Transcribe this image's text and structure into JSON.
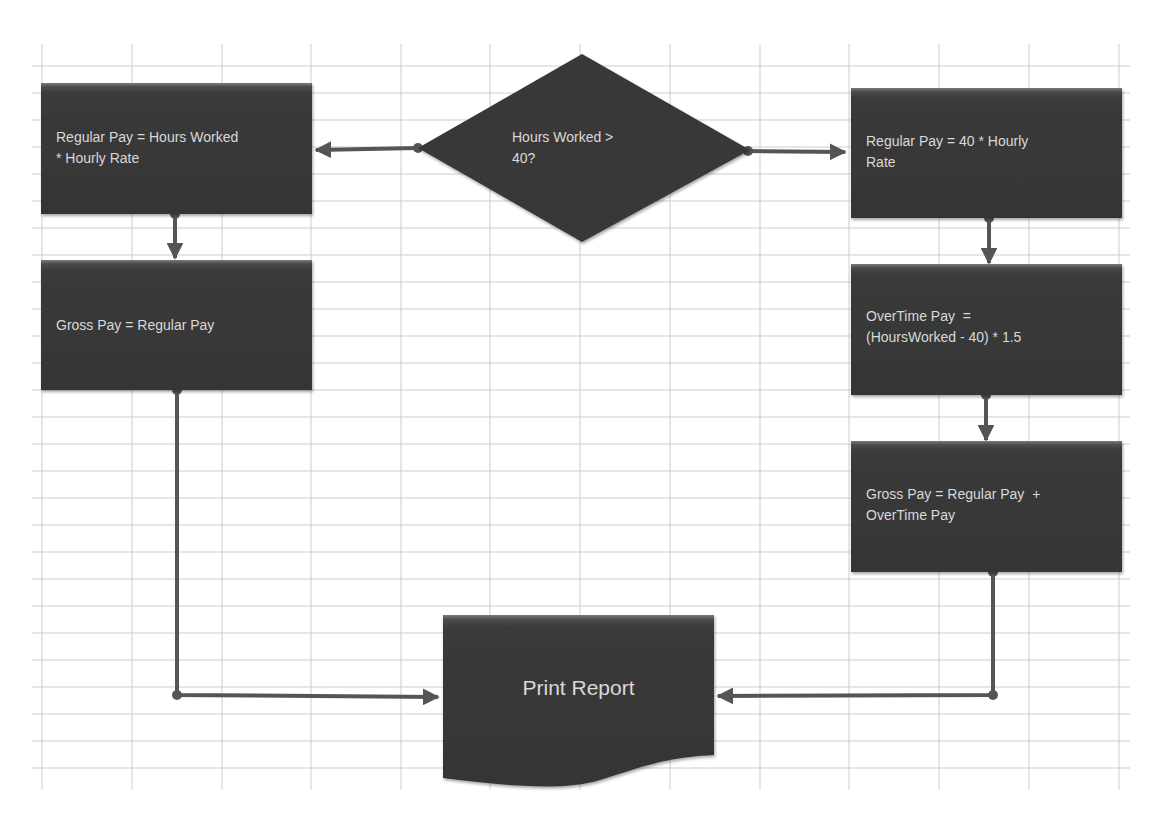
{
  "diagram": {
    "title": "",
    "type": "flowchart",
    "colors": {
      "background": "#ffffff",
      "grid": "#c8c8c8",
      "shape_fill": "#3a3a3a",
      "shape_top_highlight": "#6e6e6e",
      "text": "#d9d9d9",
      "connector": "#555555"
    },
    "nodes": {
      "decision": {
        "id": "decision",
        "shape": "diamond",
        "label": "Hours Worked > 40?",
        "line1": "Hours Worked >",
        "line2": "40?"
      },
      "left_regular": {
        "id": "left_regular",
        "shape": "process",
        "label": "Regular Pay = Hours Worked * Hourly Rate",
        "line1": "Regular Pay = Hours Worked",
        "line2": "* Hourly Rate"
      },
      "left_gross": {
        "id": "left_gross",
        "shape": "process",
        "label": "Gross Pay = Regular Pay",
        "line1": "Gross Pay = Regular Pay"
      },
      "right_regular": {
        "id": "right_regular",
        "shape": "process",
        "label": "Regular Pay = 40 * Hourly Rate",
        "line1": "Regular Pay = 40 * Hourly",
        "line2": "Rate"
      },
      "right_overtime": {
        "id": "right_overtime",
        "shape": "process",
        "label": "OverTime Pay = (HoursWorked - 40) * 1.5",
        "line1": "OverTime Pay  =",
        "line2": "(HoursWorked - 40) * 1.5"
      },
      "right_gross": {
        "id": "right_gross",
        "shape": "process",
        "label": "Gross Pay = Regular Pay + OverTime Pay",
        "line1": "Gross Pay = Regular Pay  +",
        "line2": "OverTime Pay"
      },
      "print_report": {
        "id": "print_report",
        "shape": "document",
        "label": "Print Report"
      }
    },
    "edges": [
      {
        "from": "decision",
        "to": "left_regular",
        "label": ""
      },
      {
        "from": "decision",
        "to": "right_regular",
        "label": ""
      },
      {
        "from": "left_regular",
        "to": "left_gross",
        "label": ""
      },
      {
        "from": "right_regular",
        "to": "right_overtime",
        "label": ""
      },
      {
        "from": "right_overtime",
        "to": "right_gross",
        "label": ""
      },
      {
        "from": "left_gross",
        "to": "print_report",
        "label": ""
      },
      {
        "from": "right_gross",
        "to": "print_report",
        "label": ""
      }
    ]
  }
}
